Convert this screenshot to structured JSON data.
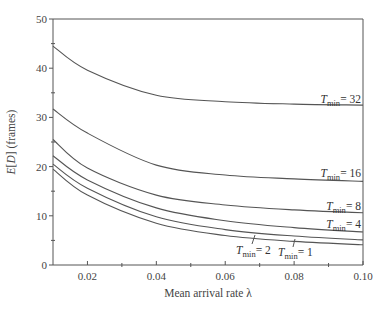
{
  "chart_data": {
    "type": "line",
    "title": "",
    "xlabel": "Mean arrival rate λ",
    "ylabel": "E[D] (frames)",
    "xlim": [
      0.01,
      0.1
    ],
    "ylim": [
      0,
      50
    ],
    "grid": false,
    "legend_position": "inline labels at right of curves",
    "x_ticks": [
      0.02,
      0.04,
      0.06,
      0.08,
      0.1
    ],
    "x_tick_labels": [
      "0.02",
      "0.04",
      "0.06",
      "0.08",
      "0.10"
    ],
    "y_ticks": [
      0,
      10,
      20,
      30,
      40,
      50
    ],
    "y_tick_labels": [
      "0",
      "10",
      "20",
      "30",
      "40",
      "50"
    ],
    "x": [
      0.01,
      0.02,
      0.04,
      0.06,
      0.08,
      0.1
    ],
    "series": [
      {
        "name": "T_min = 32",
        "label_main": "T",
        "label_sub": "min",
        "label_value": "= 32",
        "values": [
          44.5,
          39.6,
          34.5,
          33.2,
          32.7,
          32.5
        ]
      },
      {
        "name": "T_min = 16",
        "label_main": "T",
        "label_sub": "min",
        "label_value": "= 16",
        "values": [
          31.7,
          26.8,
          20.3,
          18.3,
          17.5,
          17.0
        ]
      },
      {
        "name": "T_min = 8",
        "label_main": "T",
        "label_sub": "min",
        "label_value": "= 8",
        "values": [
          25.5,
          19.7,
          14.2,
          12.2,
          11.2,
          10.6
        ]
      },
      {
        "name": "T_min = 4",
        "label_main": "T",
        "label_sub": "min",
        "label_value": "= 4",
        "values": [
          22.2,
          17.3,
          11.6,
          9.0,
          7.6,
          6.7
        ]
      },
      {
        "name": "T_min = 2",
        "label_main": "T",
        "label_sub": "min",
        "label_value": "= 2",
        "values": [
          20.5,
          15.6,
          9.8,
          7.2,
          5.9,
          5.1
        ]
      },
      {
        "name": "T_min = 1",
        "label_main": "T",
        "label_sub": "min",
        "label_value": "= 1",
        "values": [
          19.5,
          14.2,
          8.5,
          6.0,
          4.8,
          4.1
        ]
      }
    ]
  }
}
